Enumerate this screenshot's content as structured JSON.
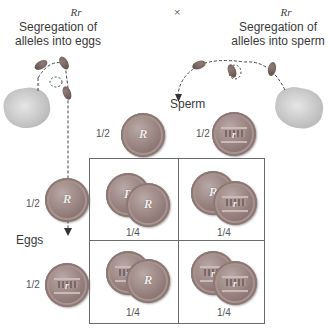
{
  "header": {
    "left_genotype": "Rr",
    "right_genotype": "Rr",
    "cross_symbol": "×"
  },
  "captions": {
    "left": "Segregation of alleles into eggs",
    "right": "Segregation of alleles into sperm"
  },
  "axes": {
    "sperm_label": "Sperm",
    "eggs_label": "Eggs"
  },
  "sperm": [
    {
      "allele": "R",
      "face": "heads",
      "fraction": "1/2"
    },
    {
      "allele": "r",
      "face": "tails",
      "fraction": "1/2"
    }
  ],
  "eggs": [
    {
      "allele": "R",
      "face": "heads",
      "fraction": "1/2"
    },
    {
      "allele": "r",
      "face": "tails",
      "fraction": "1/2"
    }
  ],
  "punnett": {
    "cells": [
      {
        "row": 0,
        "col": 0,
        "coins": [
          "R",
          "R"
        ],
        "probability": "1/4"
      },
      {
        "row": 0,
        "col": 1,
        "coins": [
          "R",
          "r"
        ],
        "probability": "1/4"
      },
      {
        "row": 1,
        "col": 0,
        "coins": [
          "r",
          "R"
        ],
        "probability": "1/4"
      },
      {
        "row": 1,
        "col": 1,
        "coins": [
          "r",
          "r"
        ],
        "probability": "1/4"
      }
    ]
  },
  "icons": {
    "left_hand": "hand-tossing-icon",
    "right_hand": "hand-tossing-icon",
    "coin_heads": "penny-heads-icon",
    "coin_tails": "penny-tails-icon"
  },
  "colors": {
    "coin": "#8f7b78",
    "grid_line": "#6a6a6a",
    "text": "#3a3a3a"
  }
}
